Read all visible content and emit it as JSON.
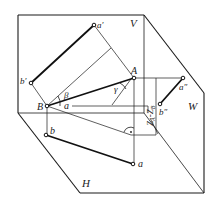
{
  "diagram": {
    "type": "orthographic-projection",
    "planes": {
      "V": "V",
      "H": "H",
      "W": "W"
    },
    "points": {
      "A": "A",
      "B": "B",
      "a_prime": "a′",
      "b_prime": "b′",
      "a_h": "a",
      "b_h": "b",
      "a_double_prime": "a″",
      "b_double_prime": "b″",
      "a_inner": "a"
    },
    "angles": {
      "beta": "β",
      "gamma": "γ"
    },
    "dimension_label": "Z",
    "dimension_sub_a": "A",
    "dimension_sub_b": "B",
    "dimension_minus": "-",
    "colors": {
      "line": "#1a1a1a",
      "background": "#ffffff"
    }
  }
}
